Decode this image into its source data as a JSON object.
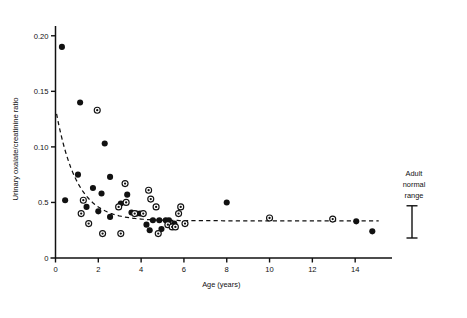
{
  "chart_data": {
    "type": "scatter",
    "title": "",
    "xlabel": "Age (years)",
    "ylabel": "Urinary oxalate/creatinine ratio",
    "xlim": [
      0,
      15.3
    ],
    "ylim": [
      0,
      0.207
    ],
    "grid": false,
    "legend_position": "none",
    "xticks": [
      0,
      2,
      4,
      6,
      8,
      10,
      12,
      14
    ],
    "xticklabels": [
      "0",
      "2",
      "4",
      "6",
      "8",
      "10",
      "12",
      "14"
    ],
    "yticks": [
      0.05,
      0.1,
      0.15,
      0.2
    ],
    "yticklabels": [
      "0.5",
      "0.10",
      "0.15",
      "0.20"
    ],
    "y_origin_label": "0",
    "series": [
      {
        "name": "filled-circle",
        "marker": "filled circle",
        "points": [
          [
            0.3,
            0.19
          ],
          [
            1.15,
            0.14
          ],
          [
            2.3,
            0.103
          ],
          [
            1.05,
            0.075
          ],
          [
            2.55,
            0.073
          ],
          [
            0.45,
            0.052
          ],
          [
            1.75,
            0.063
          ],
          [
            2.15,
            0.058
          ],
          [
            1.45,
            0.046
          ],
          [
            2.0,
            0.042
          ],
          [
            2.55,
            0.037
          ],
          [
            3.05,
            0.049
          ],
          [
            3.35,
            0.057
          ],
          [
            3.55,
            0.041
          ],
          [
            3.8,
            0.04
          ],
          [
            3.95,
            0.04
          ],
          [
            4.25,
            0.03
          ],
          [
            4.4,
            0.025
          ],
          [
            4.55,
            0.034
          ],
          [
            4.85,
            0.034
          ],
          [
            4.95,
            0.026
          ],
          [
            5.15,
            0.034
          ],
          [
            5.3,
            0.034
          ],
          [
            5.55,
            0.031
          ],
          [
            8.0,
            0.05
          ],
          [
            14.8,
            0.024
          ],
          [
            14.05,
            0.033
          ]
        ]
      },
      {
        "name": "bullseye-circle",
        "marker": "circle with center dot",
        "points": [
          [
            1.95,
            0.133
          ],
          [
            3.25,
            0.067
          ],
          [
            1.3,
            0.052
          ],
          [
            2.95,
            0.046
          ],
          [
            1.2,
            0.04
          ],
          [
            1.55,
            0.031
          ],
          [
            2.2,
            0.022
          ],
          [
            3.05,
            0.022
          ],
          [
            3.3,
            0.05
          ],
          [
            3.7,
            0.04
          ],
          [
            4.1,
            0.04
          ],
          [
            4.35,
            0.061
          ],
          [
            4.45,
            0.053
          ],
          [
            4.7,
            0.046
          ],
          [
            4.8,
            0.022
          ],
          [
            5.25,
            0.03
          ],
          [
            5.45,
            0.028
          ],
          [
            5.6,
            0.028
          ],
          [
            5.75,
            0.04
          ],
          [
            5.85,
            0.046
          ],
          [
            6.05,
            0.031
          ],
          [
            10.0,
            0.036
          ],
          [
            12.95,
            0.035
          ]
        ]
      }
    ],
    "fit_curve": {
      "name": "fitted decay curve",
      "style": "dashed",
      "description": "steeply decaying curve flattening to a horizontal asymptote",
      "y_at_x0": 0.135,
      "asymptote": 0.0335,
      "x_start": 0.05,
      "x_end": 15.1
    },
    "annotations": [
      {
        "name": "adult-normal-range",
        "text_lines": [
          "Adult",
          "normal",
          "range"
        ],
        "marker": "vertical I-beam error bar",
        "x": 15.8,
        "y_low": 0.018,
        "y_high": 0.047
      }
    ]
  },
  "colors": {
    "ink": "#111111",
    "background": "#ffffff"
  }
}
